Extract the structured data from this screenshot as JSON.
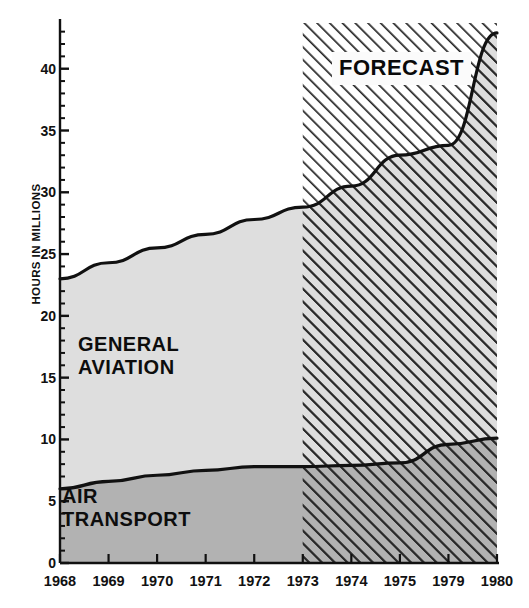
{
  "chart_data": {
    "type": "area",
    "title": "",
    "subtitle": "",
    "xlabel": "",
    "ylabel": "HOURS IN MILLIONS",
    "categories": [
      "1968",
      "1969",
      "1970",
      "1971",
      "1972",
      "1973",
      "1974",
      "1975",
      "1979",
      "1980"
    ],
    "x": [
      1968,
      1969,
      1970,
      1971,
      1972,
      1973,
      1974,
      1975,
      1979,
      1980
    ],
    "xlim": [
      1968,
      1980
    ],
    "ylim": [
      0,
      43.7
    ],
    "ytick_values": [
      0,
      5,
      10,
      15,
      20,
      25,
      30,
      35,
      40
    ],
    "ytick_labels": [
      "0",
      "5",
      "10",
      "15",
      "20",
      "25",
      "30",
      "35",
      "40"
    ],
    "yminor_step": 1,
    "grid": false,
    "legend": "inline-annotations",
    "stacked": true,
    "series": [
      {
        "name": "AIR TRANSPORT",
        "values": [
          6.0,
          6.6,
          7.1,
          7.5,
          7.8,
          7.8,
          7.9,
          8.1,
          9.6,
          10.1
        ],
        "fill": "#b2b2b2"
      },
      {
        "name": "GENERAL AVIATION",
        "values": [
          17.0,
          17.7,
          18.4,
          19.1,
          20.0,
          21.0,
          22.6,
          24.9,
          24.2,
          32.8
        ],
        "fill": "#dedede"
      }
    ],
    "cumulative_top": [
      23.0,
      24.3,
      25.5,
      26.6,
      27.8,
      28.8,
      30.5,
      33.0,
      33.8,
      42.9
    ],
    "annotations": [
      {
        "text": "FORECAST",
        "x": 1974.0,
        "y": 40.0,
        "style": "boxed-white"
      },
      {
        "text": "GENERAL\nAVIATION",
        "x": 1969.0,
        "y": 17.0,
        "style": "plain"
      },
      {
        "text": "AIR\nTRANSPORT",
        "x": 1968.6,
        "y": 4.0,
        "style": "plain"
      }
    ],
    "forecast_region": {
      "label": "FORECAST",
      "start": 1973,
      "end": 1980,
      "hatch": "forward-diagonal"
    },
    "colors": {
      "general_aviation_fill": "#dedede",
      "air_transport_fill": "#b2b2b2",
      "line": "#111111",
      "axis": "#111111",
      "hatch": "#2b2b2b",
      "background": "#ffffff"
    }
  },
  "axis": {
    "y_title": "HOURS IN MILLIONS"
  },
  "labels": {
    "forecast": "FORECAST",
    "general_aviation": "GENERAL\nAVIATION",
    "air_transport": "AIR\nTRANSPORT"
  }
}
